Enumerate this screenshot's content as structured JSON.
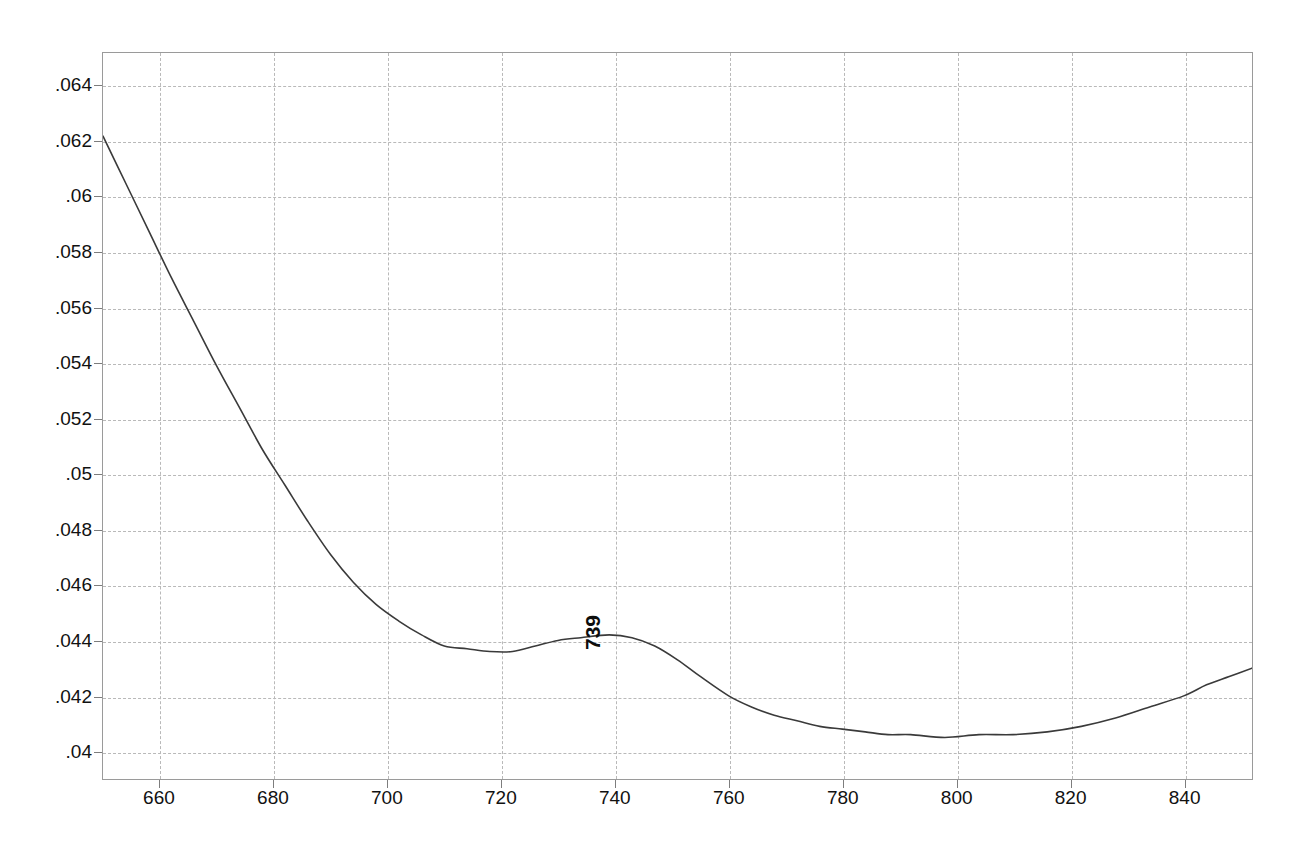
{
  "chart_data": {
    "type": "line",
    "title": "",
    "subtitle": "",
    "xlabel": "",
    "ylabel": "",
    "xlim": [
      650,
      852
    ],
    "ylim": [
      0.039,
      0.0652
    ],
    "grid": true,
    "legend": null,
    "xticks": [
      660,
      680,
      700,
      720,
      740,
      760,
      780,
      800,
      820,
      840
    ],
    "xtick_labels": [
      "660",
      "680",
      "700",
      "720",
      "740",
      "760",
      "780",
      "800",
      "820",
      "840"
    ],
    "yticks": [
      0.04,
      0.042,
      0.044,
      0.046,
      0.048,
      0.05,
      0.052,
      0.054,
      0.056,
      0.058,
      0.06,
      0.062,
      0.064
    ],
    "ytick_labels": [
      ".04",
      ".042",
      ".044",
      ".046",
      ".048",
      ".05",
      ".052",
      ".054",
      ".056",
      ".058",
      ".06",
      ".062",
      ".064"
    ],
    "annotations": [
      {
        "text": "739",
        "x": 739,
        "y": 0.0442,
        "rotation": -90,
        "name": "peak-marker-739"
      }
    ],
    "series": [
      {
        "name": "absorbance",
        "color": "#3a3a3a",
        "x": [
          650,
          654,
          658,
          662,
          666,
          670,
          674,
          678,
          682,
          686,
          690,
          694,
          698,
          702,
          706,
          710,
          714,
          718,
          722,
          726,
          730,
          734,
          739,
          743,
          747,
          751,
          755,
          760,
          764,
          768,
          772,
          776,
          780,
          784,
          788,
          792,
          798,
          804,
          810,
          816,
          822,
          828,
          834,
          840,
          844,
          848,
          852
        ],
        "y": [
          0.0622,
          0.0605,
          0.0588,
          0.0571,
          0.0555,
          0.0539,
          0.0524,
          0.0509,
          0.0496,
          0.0483,
          0.0471,
          0.0461,
          0.0453,
          0.0447,
          0.0442,
          0.0438,
          0.0437,
          0.0436,
          0.0436,
          0.0438,
          0.044,
          0.0441,
          0.0442,
          0.0441,
          0.0438,
          0.0433,
          0.0427,
          0.042,
          0.0416,
          0.0413,
          0.0411,
          0.0409,
          0.0408,
          0.0407,
          0.0406,
          0.0406,
          0.0405,
          0.0406,
          0.0406,
          0.0407,
          0.0409,
          0.0412,
          0.0416,
          0.042,
          0.0424,
          0.0427,
          0.043
        ]
      }
    ]
  },
  "geometry": {
    "plot_left": 102,
    "plot_top": 52,
    "plot_width": 1151,
    "plot_height": 728
  }
}
